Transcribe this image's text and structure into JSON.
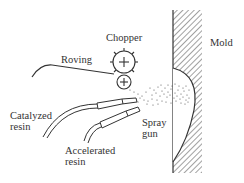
{
  "diagram": {
    "labels": {
      "chopper": "Chopper",
      "roving": "Roving",
      "mold": "Mold",
      "catalyzed_resin_line1": "Catalyzed",
      "catalyzed_resin_line2": "resin",
      "accelerated_resin_line1": "Accelerated",
      "accelerated_resin_line2": "resin",
      "spray_gun_line1": "Spray",
      "spray_gun_line2": "gun"
    },
    "colors": {
      "line": "#333333",
      "background": "#ffffff"
    }
  }
}
